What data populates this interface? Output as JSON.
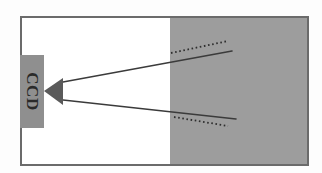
{
  "figure": {
    "name": "ccd-ray-refraction-diagram",
    "width": 322,
    "height": 173,
    "background_color": "#fdfdfd",
    "frame": {
      "label": "outer-frame",
      "x": 21,
      "y": 17,
      "width": 287,
      "height": 148,
      "stroke_color": "#6b6b6b",
      "stroke_width": 2,
      "fill_color": "#ffffff"
    },
    "medium_region": {
      "label": "gray-medium-region",
      "x": 170,
      "y": 18,
      "width": 137,
      "height": 146,
      "fill_color": "#9d9d9d"
    },
    "detector": {
      "label": "CCD",
      "box": {
        "x": 20,
        "y": 55,
        "width": 24,
        "height": 73,
        "fill_color": "#8f8f8f",
        "text_color": "#2a2a2a",
        "text_rotation_deg": 90,
        "font_size": 17
      }
    },
    "aperture": {
      "label": "aperture-triangle",
      "fill_color": "#5a5a5a",
      "apex_x": 44,
      "apex_y": 91,
      "base_x": 63,
      "base_top_y": 78,
      "base_bottom_y": 105
    },
    "rays": [
      {
        "name": "upper-ray-solid",
        "style": "solid",
        "color": "#3b3b3b",
        "width": 1.6,
        "x1": 63,
        "y1": 82,
        "x2": 232,
        "y2": 51
      },
      {
        "name": "lower-ray-solid",
        "style": "solid",
        "color": "#3b3b3b",
        "width": 1.6,
        "x1": 63,
        "y1": 100,
        "x2": 236,
        "y2": 119
      }
    ],
    "dotted_paths": [
      {
        "name": "upper-ray-dotted",
        "style": "dotted",
        "color": "#2e2e2e",
        "width": 1.8,
        "dash": "1.6 2.6",
        "x1": 171,
        "y1": 53,
        "x2": 228,
        "y2": 41
      },
      {
        "name": "lower-ray-dotted",
        "style": "dotted",
        "color": "#2e2e2e",
        "width": 1.8,
        "dash": "1.6 2.6",
        "x1": 174,
        "y1": 117,
        "x2": 228,
        "y2": 126
      }
    ]
  }
}
